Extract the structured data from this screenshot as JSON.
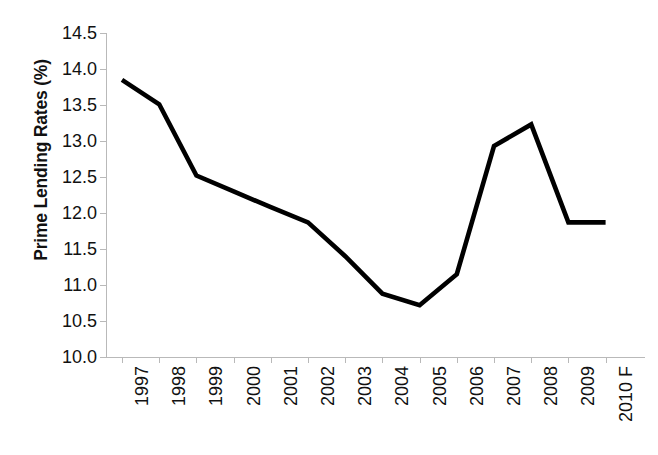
{
  "chart_data": {
    "type": "line",
    "title": "",
    "subtitle": "",
    "xlabel": "",
    "ylabel": "Prime Lending Rates (%)",
    "categories": [
      "1997",
      "1998",
      "1999",
      "2000",
      "2001",
      "2002",
      "2003",
      "2004",
      "2005",
      "2006",
      "2007",
      "2008",
      "2009",
      "2010 F"
    ],
    "values": [
      13.85,
      13.51,
      12.52,
      12.3,
      12.08,
      11.87,
      11.4,
      10.88,
      10.72,
      11.15,
      12.93,
      13.23,
      11.87,
      11.87
    ],
    "series": [
      {
        "name": "Prime Lending Rates (%)",
        "values": [
          13.85,
          13.51,
          12.52,
          12.3,
          12.08,
          11.87,
          11.4,
          10.88,
          10.72,
          11.15,
          12.93,
          13.23,
          11.87,
          11.87
        ],
        "color": "#000000"
      }
    ],
    "ylim": [
      10.0,
      14.5
    ],
    "y_ticks": [
      "10.0",
      "10.5",
      "11.0",
      "11.5",
      "12.0",
      "12.5",
      "13.0",
      "13.5",
      "14.0",
      "14.5"
    ],
    "y_tick_values": [
      10.0,
      10.5,
      11.0,
      11.5,
      12.0,
      12.5,
      13.0,
      13.5,
      14.0,
      14.5
    ],
    "grid": false,
    "legend": false,
    "legend_position": "none",
    "x_tick_rotation": -90,
    "annotations": [],
    "colors": {
      "line": "#000000",
      "axis": "#b9b9b9",
      "text": "#111111",
      "background": "#ffffff"
    }
  }
}
